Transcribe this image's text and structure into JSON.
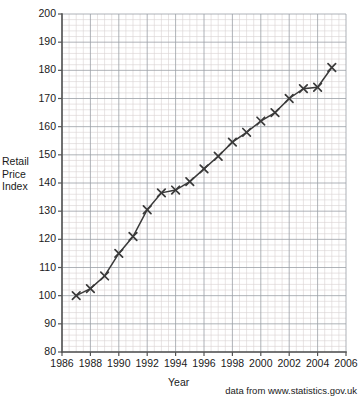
{
  "chart_data": {
    "type": "line",
    "title": "",
    "subtitle": "",
    "xlabel": "Year",
    "ylabel": "Retail Price Index",
    "ylabel_lines": [
      "Retail",
      "Price",
      "Index"
    ],
    "xlim": [
      1986,
      2006
    ],
    "ylim": [
      80,
      200
    ],
    "y_major_step": 10,
    "y_minor_step": 2,
    "x_major_step": 2,
    "x_minor_step": 0.5,
    "grid": true,
    "grid_style": "graph-paper major and minor gridlines",
    "legend": null,
    "marker": "x-cross",
    "line_color": "#3a3a3a",
    "grid_major_color": "#9aa0a6",
    "grid_minor_color": "#d9d2d2",
    "axis_color": "#555555",
    "xtick_labels": [
      "1986",
      "1988",
      "1990",
      "1992",
      "1994",
      "1996",
      "1998",
      "2000",
      "2002",
      "2004",
      "2006"
    ],
    "xtick_values": [
      1986,
      1988,
      1990,
      1992,
      1994,
      1996,
      1998,
      2000,
      2002,
      2004,
      2006
    ],
    "ytick_labels": [
      "80",
      "90",
      "100",
      "110",
      "120",
      "130",
      "140",
      "150",
      "160",
      "170",
      "180",
      "190",
      "200"
    ],
    "ytick_values": [
      80,
      90,
      100,
      110,
      120,
      130,
      140,
      150,
      160,
      170,
      180,
      190,
      200
    ],
    "x": [
      1987,
      1988,
      1989,
      1990,
      1991,
      1992,
      1993,
      1994,
      1995,
      1996,
      1997,
      1998,
      1999,
      2000,
      2001,
      2002,
      2003,
      2004,
      2005
    ],
    "values": [
      100,
      102.5,
      107,
      115,
      121,
      130.5,
      136.5,
      137.5,
      140.5,
      145,
      149.5,
      154.5,
      158,
      162,
      165,
      170,
      173.5,
      174,
      181
    ],
    "series": [
      {
        "name": "Retail Price Index",
        "x": [
          1987,
          1988,
          1989,
          1990,
          1991,
          1992,
          1993,
          1994,
          1995,
          1996,
          1997,
          1998,
          1999,
          2000,
          2001,
          2002,
          2003,
          2004,
          2005
        ],
        "values": [
          100,
          102.5,
          107,
          115,
          121,
          130.5,
          136.5,
          137.5,
          140.5,
          145,
          149.5,
          154.5,
          158,
          162,
          165,
          170,
          173.5,
          174,
          181
        ]
      }
    ],
    "annotations": [
      "data from www.statistics.gov.uk"
    ]
  },
  "source_note": "data from www.statistics.gov.uk",
  "axis": {
    "x_title": "Year",
    "y_title_lines": [
      "Retail",
      "Price",
      "Index"
    ]
  }
}
